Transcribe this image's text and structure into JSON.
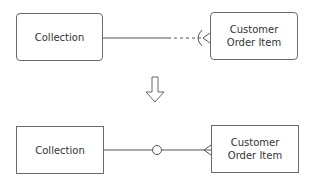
{
  "before": {
    "left_entity": "Collection",
    "right_entity": "Customer\nOrder Item",
    "relationship": {
      "left_end": "solid line",
      "right_end": "dashed line",
      "right_symbol": "optional-many (crow's foot with open arc)"
    }
  },
  "transform_arrow": "down",
  "after": {
    "left_entity": "Collection",
    "right_entity": "Customer\nOrder Item",
    "relationship": {
      "line": "solid",
      "middle_symbol": "zero (circle)",
      "right_symbol": "many (crow's foot)"
    }
  },
  "colors": {
    "line": "#555555",
    "border": "#6a6a6a",
    "text": "#333333"
  }
}
